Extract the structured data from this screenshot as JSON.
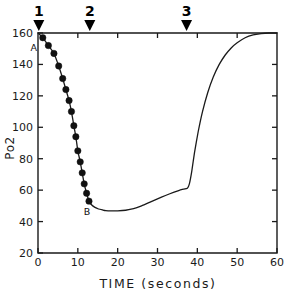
{
  "chart_data": {
    "type": "line",
    "title": "",
    "xlabel": "TIME  (seconds)",
    "ylabel": "Po2",
    "xlim": [
      0,
      60
    ],
    "ylim": [
      20,
      160
    ],
    "xticks": [
      0,
      10,
      20,
      30,
      40,
      50,
      60
    ],
    "yticks": [
      20,
      40,
      60,
      80,
      100,
      120,
      140,
      160
    ],
    "xtick_labels": [
      "0",
      "10",
      "20",
      "30",
      "40",
      "50",
      "60"
    ],
    "ytick_labels": [
      "20",
      "40",
      "60",
      "80",
      "100",
      "120",
      "140",
      "160"
    ],
    "grid": false,
    "legend": "none",
    "series": [
      {
        "name": "Po2 trace",
        "style": "solid-line-with-markers-on-descent",
        "x": [
          0.0,
          1.2,
          2.6,
          4.0,
          5.2,
          6.2,
          7.0,
          7.8,
          8.4,
          9.0,
          9.5,
          10.0,
          10.6,
          11.1,
          11.6,
          12.2,
          12.8,
          13.5,
          14.3,
          15.2,
          16.2,
          17.0,
          18.5,
          20.0,
          22.0,
          24.0,
          26.0,
          28.0,
          30.0,
          32.0,
          34.0,
          36.0,
          37.5,
          38.0,
          38.6,
          39.3,
          40.2,
          41.3,
          42.6,
          44.0,
          45.5,
          47.0,
          48.5,
          50.0,
          52.0,
          54.0,
          56.0,
          58.0,
          60.0
        ],
        "y": [
          160,
          157,
          152,
          147,
          139,
          131,
          124,
          117,
          110,
          101,
          94,
          85,
          78,
          71,
          64,
          58,
          53,
          50.5,
          49.0,
          48.0,
          47.4,
          47.0,
          46.8,
          46.8,
          47.2,
          48.2,
          50.0,
          52.2,
          54.4,
          56.6,
          58.6,
          60.4,
          61.2,
          64,
          72,
          84,
          97,
          110,
          122,
          132,
          140,
          146,
          150.5,
          153.8,
          157,
          158.8,
          159.6,
          160,
          160
        ]
      }
    ],
    "markers": [
      {
        "x": 1.2,
        "y": 157,
        "label": "A",
        "filled": true
      },
      {
        "x": 2.6,
        "y": 152,
        "label": "",
        "filled": true
      },
      {
        "x": 4.0,
        "y": 147,
        "label": "",
        "filled": true
      },
      {
        "x": 5.2,
        "y": 139,
        "label": "",
        "filled": true
      },
      {
        "x": 6.2,
        "y": 131,
        "label": "",
        "filled": true
      },
      {
        "x": 7.0,
        "y": 124,
        "label": "",
        "filled": true
      },
      {
        "x": 7.8,
        "y": 117,
        "label": "",
        "filled": true
      },
      {
        "x": 8.4,
        "y": 110,
        "label": "",
        "filled": true
      },
      {
        "x": 9.0,
        "y": 101,
        "label": "",
        "filled": true
      },
      {
        "x": 9.5,
        "y": 94,
        "label": "",
        "filled": true
      },
      {
        "x": 10.0,
        "y": 85,
        "label": "",
        "filled": true
      },
      {
        "x": 10.6,
        "y": 78,
        "label": "",
        "filled": true
      },
      {
        "x": 11.1,
        "y": 71,
        "label": "",
        "filled": true
      },
      {
        "x": 11.6,
        "y": 64,
        "label": "",
        "filled": true
      },
      {
        "x": 12.2,
        "y": 58,
        "label": "",
        "filled": true
      },
      {
        "x": 12.8,
        "y": 53,
        "label": "B",
        "filled": true
      }
    ],
    "annotations": [
      {
        "name": "point-a",
        "text": "A",
        "x": 1.2,
        "y": 157,
        "dx": -9,
        "dy": 13
      },
      {
        "name": "point-b",
        "text": "B",
        "x": 12.8,
        "y": 53,
        "dx": -2,
        "dy": 14
      }
    ],
    "event_markers": [
      {
        "id": "1",
        "x": 0.2,
        "label": "1"
      },
      {
        "id": "2",
        "x": 13.0,
        "label": "2"
      },
      {
        "id": "3",
        "x": 37.3,
        "label": "3"
      }
    ]
  },
  "colors": {
    "axis": "#1a1a1a",
    "curve": "#1a1a1a",
    "marker_fill": "#111111",
    "background": "#ffffff",
    "arrow": "#000000"
  }
}
